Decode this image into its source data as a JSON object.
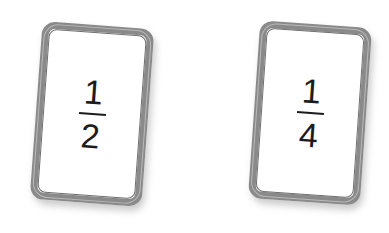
{
  "scene": {
    "background_color": "#ffffff",
    "description": "Two fraction flashcards on a white background"
  },
  "style": {
    "card_background": "#ffffff",
    "card_border_color": "#8a8a8a",
    "card_inner_edge_color": "#6f6f6f",
    "card_outer_edge_color": "#b9b9b9",
    "text_color": "#1c1c1c",
    "shadow_color": "rgba(120,120,120,0.38)"
  },
  "cards": [
    {
      "id": "one-half",
      "numerator": "1",
      "denominator": "2",
      "label": "1/2",
      "rotation_deg": 4.2
    },
    {
      "id": "one-quarter",
      "numerator": "1",
      "denominator": "4",
      "label": "1/4",
      "rotation_deg": 4.0
    }
  ]
}
